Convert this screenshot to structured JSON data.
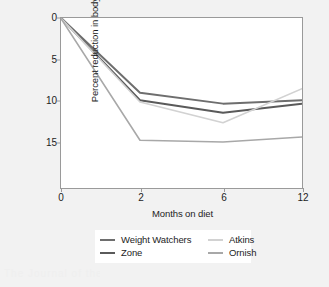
{
  "chart_data": {
    "type": "line",
    "title": "",
    "subtitle": "",
    "xlabel": "Months on diet",
    "ylabel": "Percent reduction in body weight",
    "x": [
      0,
      2,
      6,
      12
    ],
    "xticklabels": [
      "0",
      "2",
      "6",
      "12"
    ],
    "yticklabels": [
      "0",
      "5",
      "10",
      "15"
    ],
    "yticks": [
      0,
      5,
      10,
      15
    ],
    "ylim": [
      0,
      20.5
    ],
    "y_axis_inverted": true,
    "x_axis_spacing": "non-linear (category-like positions for 0, 2, 6, 12)",
    "grid": false,
    "legend_position": "below-axes",
    "series": [
      {
        "name": "Weight Watchers",
        "color": "#6e6e6e",
        "width": 2.0,
        "values": [
          0.0,
          9.1,
          10.4,
          10.0
        ]
      },
      {
        "name": "Zone",
        "color": "#5a5a5a",
        "width": 2.0,
        "values": [
          0.0,
          10.0,
          11.5,
          10.4
        ]
      },
      {
        "name": "Atkins",
        "color": "#d2d2d2",
        "width": 1.6,
        "values": [
          0.0,
          10.2,
          12.7,
          8.6
        ]
      },
      {
        "name": "Ornish",
        "color": "#a8a8a8",
        "width": 1.6,
        "values": [
          0.0,
          14.8,
          15.0,
          14.4
        ]
      }
    ]
  },
  "figure": {
    "background_color": "#f2f2f2",
    "plot_background_color": "#ffffff",
    "frame_color": "#9a9a9a",
    "text_color": "#1d1d1d",
    "scan_artifact_text": "The Journal of the"
  },
  "legend": {
    "entries": [
      {
        "label": "Weight Watchers",
        "color": "#6e6e6e"
      },
      {
        "label": "Atkins",
        "color": "#d2d2d2"
      },
      {
        "label": "Zone",
        "color": "#5a5a5a"
      },
      {
        "label": "Ornish",
        "color": "#a8a8a8"
      }
    ]
  }
}
